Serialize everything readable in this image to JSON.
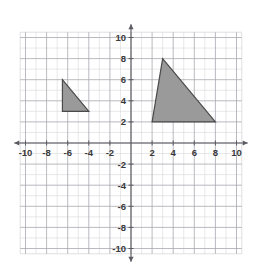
{
  "figure": {
    "kind": "coordinate-plane",
    "background_color": "#ffffff",
    "grid_minor_color": "#d8d8dc",
    "grid_major_color": "#a8a8b0",
    "axis_color": "#5a5a62",
    "label_color": "#3a3a3a"
  },
  "chart_data": {
    "type": "scatter",
    "title": "",
    "subtitle": "",
    "xlabel": "",
    "ylabel": "",
    "xlim": [
      -10.5,
      10.5
    ],
    "ylim": [
      -10.5,
      10.5
    ],
    "grid": true,
    "grid_step": 1,
    "legend": "none",
    "x_tick_labels": [
      "-10",
      "-8",
      "-6",
      "-4",
      "-2",
      "2",
      "4",
      "6",
      "8",
      "10"
    ],
    "x_tick_values": [
      -10,
      -8,
      -6,
      -4,
      -2,
      2,
      4,
      6,
      8,
      10
    ],
    "y_tick_labels": [
      "10",
      "8",
      "6",
      "4",
      "2",
      "-2",
      "-4",
      "-6",
      "-8",
      "-10"
    ],
    "y_tick_values": [
      10,
      8,
      6,
      4,
      2,
      -2,
      -4,
      -6,
      -8,
      -10
    ],
    "shapes": [
      {
        "name": "small-triangle",
        "type": "polygon",
        "fill": "#9a9a9a",
        "stroke": "#4a4a4a",
        "vertices": [
          [
            -6.5,
            6
          ],
          [
            -6.5,
            3
          ],
          [
            -4,
            3
          ]
        ]
      },
      {
        "name": "large-triangle",
        "type": "polygon",
        "fill": "#9a9a9a",
        "stroke": "#4a4a4a",
        "vertices": [
          [
            3,
            8
          ],
          [
            2,
            2
          ],
          [
            8,
            2
          ]
        ]
      }
    ]
  },
  "axes": {
    "x_axis_label": "x",
    "y_axis_label": "y",
    "x_ticks": [
      {
        "label": "-10",
        "value": -10
      },
      {
        "label": "-8",
        "value": -8
      },
      {
        "label": "-6",
        "value": -6
      },
      {
        "label": "-4",
        "value": -4
      },
      {
        "label": "-2",
        "value": -2
      },
      {
        "label": "2",
        "value": 2
      },
      {
        "label": "4",
        "value": 4
      },
      {
        "label": "6",
        "value": 6
      },
      {
        "label": "8",
        "value": 8
      },
      {
        "label": "10",
        "value": 10
      }
    ],
    "y_ticks": [
      {
        "label": "10",
        "value": 10
      },
      {
        "label": "8",
        "value": 8
      },
      {
        "label": "6",
        "value": 6
      },
      {
        "label": "4",
        "value": 4
      },
      {
        "label": "2",
        "value": 2
      },
      {
        "label": "-2",
        "value": -2
      },
      {
        "label": "-4",
        "value": -4
      },
      {
        "label": "-6",
        "value": -6
      },
      {
        "label": "-8",
        "value": -8
      },
      {
        "label": "-10",
        "value": -10
      }
    ]
  }
}
